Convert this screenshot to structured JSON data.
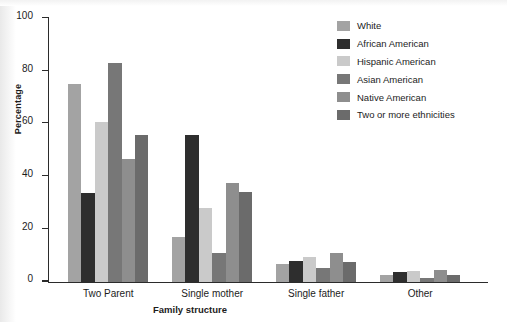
{
  "chart_data": {
    "type": "bar",
    "title": "",
    "xlabel": "Family structure",
    "ylabel": "Percentage",
    "ylim": [
      0,
      100
    ],
    "yticks": [
      0,
      20,
      40,
      60,
      80,
      100
    ],
    "grid": false,
    "legend_position": "top-right",
    "categories": [
      "Two Parent",
      "Single mother",
      "Single father",
      "Other"
    ],
    "series": [
      {
        "name": "White",
        "color": "#a3a3a3",
        "values": [
          75.0,
          17.0,
          6.5,
          2.5
        ]
      },
      {
        "name": "African American",
        "color": "#2e2e2e",
        "values": [
          33.5,
          55.5,
          8.0,
          3.5
        ]
      },
      {
        "name": "Hispanic American",
        "color": "#cacaca",
        "values": [
          60.5,
          28.0,
          9.5,
          4.0
        ]
      },
      {
        "name": "Asian American",
        "color": "#777777",
        "values": [
          83.0,
          11.0,
          5.0,
          1.5
        ]
      },
      {
        "name": "Native American",
        "color": "#8e8e8e",
        "values": [
          46.5,
          37.5,
          11.0,
          4.5
        ]
      },
      {
        "name": "Two or more ethnicities",
        "color": "#6b6b6b",
        "values": [
          55.5,
          34.0,
          7.5,
          2.5
        ]
      }
    ]
  },
  "axes": {
    "y_title": "Percentage",
    "x_title": "Family structure",
    "y_tick_labels": [
      "0",
      "20",
      "40",
      "60",
      "80",
      "100"
    ]
  },
  "legend": {
    "items": [
      {
        "label": "White"
      },
      {
        "label": "African American"
      },
      {
        "label": "Hispanic American"
      },
      {
        "label": "Asian American"
      },
      {
        "label": "Native American"
      },
      {
        "label": "Two or more ethnicities"
      }
    ]
  }
}
